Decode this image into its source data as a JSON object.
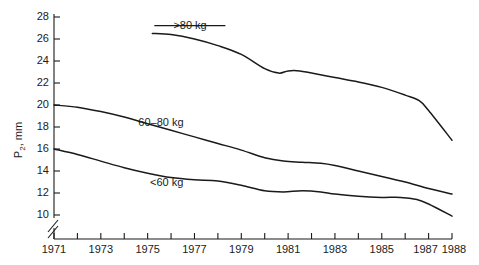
{
  "chart_data": {
    "type": "line",
    "title": "",
    "xlabel": "",
    "ylabel": "P2, mm",
    "ylabel_base": "P",
    "ylabel_sub": "2",
    "ylabel_unit": ", mm",
    "xlim": [
      1971,
      1988
    ],
    "ylim": [
      9,
      28
    ],
    "grid": false,
    "legend_position": "inline-annotations",
    "axis_break": true,
    "axis_break_note": "y-axis broken below 10",
    "y_ticks": [
      10,
      12,
      14,
      16,
      18,
      20,
      22,
      24,
      26,
      28
    ],
    "y_tick_labels": [
      "10",
      "12",
      "14",
      "16",
      "18",
      "20",
      "22",
      "24",
      "26",
      "28"
    ],
    "x_ticks": [
      1971,
      1972,
      1973,
      1974,
      1975,
      1976,
      1977,
      1978,
      1979,
      1980,
      1981,
      1982,
      1983,
      1984,
      1985,
      1986,
      1987,
      1988
    ],
    "x_tick_labels": [
      "1971",
      "",
      "1973",
      "",
      "1975",
      "",
      "1977",
      "",
      "1979",
      "",
      "1981",
      "",
      "1983",
      "",
      "1985",
      "",
      "1987",
      "1988"
    ],
    "line_color": "#1a1a1a",
    "series": [
      {
        "name": ">80 kg",
        "label": ">80 kg",
        "label_x": 1976.1,
        "label_y": 26.9,
        "leader_line": true,
        "x": [
          1975.2,
          1976,
          1977,
          1978,
          1979,
          1980,
          1980.6,
          1981,
          1981.5,
          1982,
          1983,
          1984,
          1985,
          1986,
          1986.6,
          1987,
          1988
        ],
        "values": [
          26.5,
          26.4,
          26.0,
          25.4,
          24.6,
          23.3,
          22.9,
          23.1,
          23.1,
          22.9,
          22.5,
          22.1,
          21.6,
          20.9,
          20.4,
          19.5,
          16.8
        ]
      },
      {
        "name": "60-80 kg",
        "label": "60–80 kg",
        "label_x": 1974.6,
        "label_y": 18.1,
        "leader_line": false,
        "x": [
          1971,
          1972,
          1973,
          1974,
          1975,
          1976,
          1977,
          1978,
          1979,
          1980,
          1980.8,
          1981.6,
          1982.4,
          1983,
          1984,
          1985,
          1986,
          1987,
          1988
        ],
        "values": [
          20.0,
          19.8,
          19.4,
          18.9,
          18.3,
          17.7,
          17.1,
          16.5,
          15.9,
          15.2,
          14.9,
          14.8,
          14.7,
          14.5,
          14.0,
          13.5,
          13.0,
          12.4,
          11.9
        ]
      },
      {
        "name": "<60 kg",
        "label": "<60 kg",
        "label_x": 1975.1,
        "label_y": 12.6,
        "leader_line": false,
        "x": [
          1971,
          1972,
          1973,
          1974,
          1975,
          1976,
          1977,
          1978,
          1979,
          1980,
          1980.8,
          1981.6,
          1982.4,
          1983,
          1984,
          1985,
          1985.8,
          1986.5,
          1987,
          1988
        ],
        "values": [
          16.0,
          15.5,
          14.9,
          14.3,
          13.8,
          13.4,
          13.2,
          13.1,
          12.7,
          12.2,
          12.1,
          12.2,
          12.1,
          11.9,
          11.7,
          11.6,
          11.6,
          11.4,
          11.0,
          9.9
        ]
      }
    ]
  }
}
